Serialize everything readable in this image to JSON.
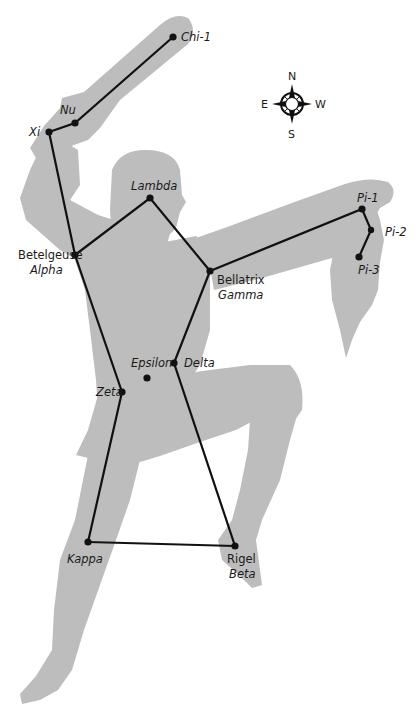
{
  "figure": {
    "colors": {
      "silhouette": "#bdbdbd",
      "lines": "#111111",
      "background": "#ffffff"
    }
  },
  "compass": {
    "n": "N",
    "s": "S",
    "e": "E",
    "w": "W"
  },
  "stars": [
    {
      "id": "chi1",
      "name": "Chi-1",
      "x": 173,
      "y": 37,
      "italic": true
    },
    {
      "id": "nu",
      "name": "Nu",
      "x": 75,
      "y": 123,
      "italic": true
    },
    {
      "id": "xi",
      "name": "Xi",
      "x": 49,
      "y": 132,
      "italic": true
    },
    {
      "id": "lambda",
      "name": "Lambda",
      "x": 150,
      "y": 198,
      "italic": true
    },
    {
      "id": "betelgeuse",
      "name": "Betelgeuse",
      "alt": "Alpha",
      "x": 75,
      "y": 255
    },
    {
      "id": "bellatrix",
      "name": "Bellatrix",
      "alt": "Gamma",
      "x": 210,
      "y": 271
    },
    {
      "id": "pi1",
      "name": "Pi-1",
      "x": 362,
      "y": 209,
      "italic": true
    },
    {
      "id": "pi2",
      "name": "Pi-2",
      "x": 371,
      "y": 230,
      "italic": true
    },
    {
      "id": "pi3",
      "name": "Pi-3",
      "x": 359,
      "y": 257,
      "italic": true
    },
    {
      "id": "delta",
      "name": "Delta",
      "x": 174,
      "y": 363,
      "italic": true
    },
    {
      "id": "epsilon",
      "name": "Epsilon",
      "x": 147,
      "y": 378,
      "italic": true
    },
    {
      "id": "zeta",
      "name": "Zeta",
      "x": 122,
      "y": 392,
      "italic": true
    },
    {
      "id": "kappa",
      "name": "Kappa",
      "x": 88,
      "y": 542,
      "italic": true
    },
    {
      "id": "rigel",
      "name": "Rigel",
      "alt": "Beta",
      "x": 235,
      "y": 546
    }
  ],
  "connections": [
    [
      "chi1",
      "nu"
    ],
    [
      "nu",
      "xi"
    ],
    [
      "xi",
      "betelgeuse"
    ],
    [
      "betelgeuse",
      "zeta"
    ],
    [
      "betelgeuse",
      "lambda"
    ],
    [
      "lambda",
      "bellatrix"
    ],
    [
      "bellatrix",
      "pi1"
    ],
    [
      "pi1",
      "pi2"
    ],
    [
      "pi2",
      "pi3"
    ],
    [
      "bellatrix",
      "delta"
    ],
    [
      "delta",
      "rigel"
    ],
    [
      "zeta",
      "kappa"
    ],
    [
      "kappa",
      "rigel"
    ]
  ],
  "labels": {
    "chi1": "Chi-1",
    "nu": "Nu",
    "xi": "Xi",
    "lambda": "Lambda",
    "betelgeuse": "Betelgeuse",
    "alpha": "Alpha",
    "bellatrix": "Bellatrix",
    "gamma": "Gamma",
    "pi1": "Pi-1",
    "pi2": "Pi-2",
    "pi3": "Pi-3",
    "epsilon": "Epsilon",
    "delta": "Delta",
    "zeta": "Zeta",
    "kappa": "Kappa",
    "rigel": "Rigel",
    "beta": "Beta"
  }
}
